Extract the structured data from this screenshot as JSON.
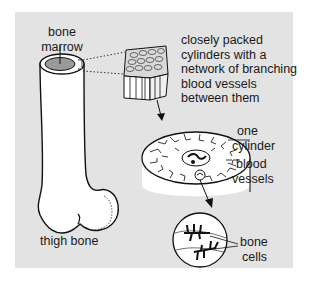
{
  "diagram": {
    "background_color": "#e3e3e3",
    "labels": {
      "bone_marrow": [
        "bone",
        "marrow"
      ],
      "description": [
        "closely packed",
        "cylinders with a",
        "network of branching",
        "blood vessels",
        "between them"
      ],
      "one_cylinder": [
        "one",
        "cylinder"
      ],
      "blood_vessels": [
        "blood",
        "vessels"
      ],
      "bone_cells": [
        "bone",
        "cells"
      ],
      "thigh_bone": "thigh bone"
    },
    "parts": [
      {
        "id": "thigh-bone",
        "label": "thigh bone"
      },
      {
        "id": "bone-marrow",
        "label": "bone marrow",
        "color": "#9a9a9a"
      },
      {
        "id": "cylinder-block",
        "label": "closely packed cylinders with a network of branching blood vessels between them"
      },
      {
        "id": "one-cylinder",
        "label": "one cylinder"
      },
      {
        "id": "blood-vessels",
        "label": "blood vessels"
      },
      {
        "id": "bone-cells",
        "label": "bone cells"
      }
    ]
  }
}
